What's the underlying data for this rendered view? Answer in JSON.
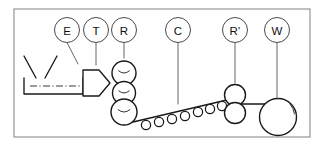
{
  "figure": {
    "frame": {
      "x": 14,
      "y": 9,
      "width": 296,
      "height": 128,
      "stroke": "#8c8c8c"
    },
    "canvas": {
      "width": 322,
      "height": 146,
      "background": "#ffffff"
    },
    "ink_color": "#1a1a1a",
    "leader_color": "#555555"
  },
  "labels": [
    {
      "id": "E",
      "text": "E",
      "name": "extruder",
      "cx": 67,
      "cy": 30,
      "r": 12.5,
      "leader": [
        [
          67,
          42.5
        ],
        [
          78,
          64
        ]
      ]
    },
    {
      "id": "T",
      "text": "T",
      "name": "die-head",
      "cx": 96,
      "cy": 30,
      "r": 12.5,
      "leader": [
        [
          96,
          42.5
        ],
        [
          96,
          65
        ]
      ]
    },
    {
      "id": "R",
      "text": "R",
      "name": "calender-rolls",
      "cx": 124,
      "cy": 30,
      "r": 12.5,
      "leader": [
        [
          124,
          42.5
        ],
        [
          124,
          58
        ]
      ]
    },
    {
      "id": "C",
      "text": "C",
      "name": "conveyor",
      "cx": 178,
      "cy": 30,
      "r": 12.5,
      "leader": [
        [
          178,
          42.5
        ],
        [
          178,
          104
        ]
      ]
    },
    {
      "id": "R'",
      "text": "R’",
      "name": "pull-rolls",
      "cx": 235,
      "cy": 30,
      "r": 12.5,
      "leader": [
        [
          235,
          42.5
        ],
        [
          235,
          83
        ]
      ]
    },
    {
      "id": "W",
      "text": "W",
      "name": "winder",
      "cx": 277,
      "cy": 30,
      "r": 12.5,
      "leader": [
        [
          277,
          42.5
        ],
        [
          277,
          99
        ]
      ]
    }
  ],
  "components": {
    "hopper": {
      "name": "feed-hopper",
      "left_chute": [
        [
          24,
          56
        ],
        [
          36,
          78
        ]
      ],
      "right_chute": [
        [
          57,
          56
        ],
        [
          45,
          78
        ]
      ],
      "note": "open V funnel above the barrel"
    },
    "barrel": {
      "name": "extruder-barrel",
      "points": "24,78 24,94 83,94 83,78",
      "top_y": 78,
      "bottom_y": 94,
      "left_x": 24,
      "right_x": 83
    },
    "centerline": {
      "name": "machine-centerline",
      "from": [
        30,
        86
      ],
      "to": [
        103,
        86
      ]
    },
    "die": {
      "name": "sheet-die",
      "points": "83,70 99,70 110,83 99,96 83,96",
      "tip_x": 110,
      "tip_y": 83
    },
    "calender_stack": {
      "name": "calender-roll-stack",
      "rolls": [
        {
          "cx": 124,
          "cy": 73,
          "r": 12.0,
          "name": "calender-roll-top"
        },
        {
          "cx": 124,
          "cy": 93,
          "r": 11.5,
          "name": "calender-roll-mid"
        },
        {
          "cx": 124,
          "cy": 112,
          "r": 13.0,
          "name": "calender-roll-bottom"
        }
      ]
    },
    "conveyor": {
      "name": "cooling-conveyor",
      "belt_from": [
        133,
        122
      ],
      "belt_to": [
        231,
        99
      ],
      "roller_radius": 4.6,
      "rollers": [
        {
          "cx": 146,
          "cy": 125,
          "name": "conveyor-roller"
        },
        {
          "cx": 159,
          "cy": 122,
          "name": "conveyor-roller"
        },
        {
          "cx": 172,
          "cy": 119,
          "name": "conveyor-roller"
        },
        {
          "cx": 185,
          "cy": 116,
          "name": "conveyor-roller"
        },
        {
          "cx": 198,
          "cy": 112,
          "name": "conveyor-roller"
        },
        {
          "cx": 210,
          "cy": 109,
          "name": "conveyor-roller"
        },
        {
          "cx": 222,
          "cy": 106,
          "name": "conveyor-roller"
        }
      ]
    },
    "pull_rolls": {
      "name": "pull-roll-nip",
      "rolls": [
        {
          "cx": 235,
          "cy": 95,
          "r": 10.5,
          "name": "pull-roll-upper"
        },
        {
          "cx": 235,
          "cy": 113,
          "r": 10.5,
          "name": "pull-roll-lower"
        }
      ],
      "exit_web": {
        "from": [
          241,
          104
        ],
        "to": [
          277,
          104
        ]
      }
    },
    "winder": {
      "name": "winder-roll",
      "cx": 278,
      "cy": 117,
      "r": 18.5,
      "scuff_arc": "M 290 104 A 18 18 0 0 1 294.5 114"
    }
  }
}
